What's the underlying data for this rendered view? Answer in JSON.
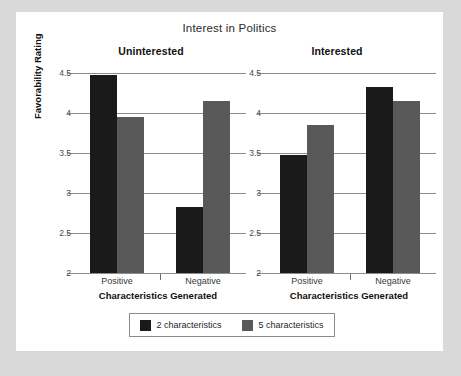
{
  "figure": {
    "title": "Interest in Politics",
    "background_color": "#d9d9d9",
    "card_color": "#ffffff"
  },
  "chart_data": {
    "type": "bar",
    "title": "Interest in Politics",
    "xlabel": "Characteristics Generated",
    "ylabel": "Favorability Rating",
    "ylim": [
      2,
      4.6
    ],
    "yticks": [
      2,
      2.5,
      3,
      3.5,
      4,
      4.5
    ],
    "ytick_labels": [
      "2",
      "2.5",
      "3",
      "3.5",
      "4",
      "4.5"
    ],
    "categories": [
      "Positive",
      "Negative"
    ],
    "grid": true,
    "legend_position": "bottom",
    "panels": [
      {
        "name": "Uninterested",
        "series": [
          {
            "name": "2 characteristics",
            "color": "#1a1a1a",
            "values": [
              4.48,
              2.83
            ]
          },
          {
            "name": "5 characteristics",
            "color": "#595959",
            "values": [
              3.95,
              4.15
            ]
          }
        ]
      },
      {
        "name": "Interested",
        "series": [
          {
            "name": "2 characteristics",
            "color": "#1a1a1a",
            "values": [
              3.48,
              4.33
            ]
          },
          {
            "name": "5 characteristics",
            "color": "#595959",
            "values": [
              3.85,
              4.15
            ]
          }
        ]
      }
    ],
    "legend": [
      {
        "label": "2 characteristics",
        "color": "#1a1a1a"
      },
      {
        "label": "5 characteristics",
        "color": "#595959"
      }
    ]
  },
  "axes": {
    "ylabel": "Favorability Rating",
    "ytick_labels": [
      "4.5",
      "4",
      "3.5",
      "3",
      "2.5",
      "2"
    ],
    "xtick_labels": [
      "Positive",
      "Negative"
    ],
    "xlabel_left": "Characteristics Generated",
    "xlabel_right": "Characteristics Generated"
  },
  "panel_titles": {
    "left": "Uninterested",
    "right": "Interested"
  },
  "legend": {
    "entries": [
      {
        "label": "2 characteristics"
      },
      {
        "label": "5 characteristics"
      }
    ]
  }
}
